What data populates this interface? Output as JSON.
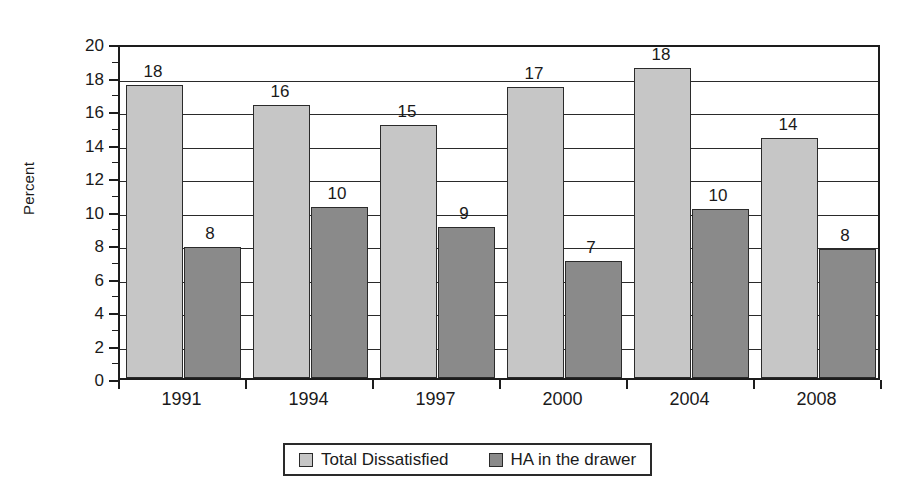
{
  "chart_data": {
    "type": "bar",
    "title": "",
    "xlabel": "",
    "ylabel": "Percent",
    "ylim": [
      0,
      20
    ],
    "ytick_step": 2,
    "yticks": [
      0,
      2,
      4,
      6,
      8,
      10,
      12,
      14,
      16,
      18,
      20
    ],
    "grid": true,
    "legend_position": "bottom",
    "categories": [
      "1991",
      "1994",
      "1997",
      "2000",
      "2004",
      "2008"
    ],
    "series": [
      {
        "name": "Total Dissatisfied",
        "color": "#c6c6c6",
        "values": [
          17.5,
          16.3,
          15.1,
          17.4,
          18.5,
          14.3
        ],
        "labels": [
          "18",
          "16",
          "15",
          "17",
          "18",
          "14"
        ]
      },
      {
        "name": "HA in the drawer",
        "color": "#8a8a8a",
        "values": [
          7.8,
          10.2,
          9.0,
          7.0,
          10.1,
          7.7
        ],
        "labels": [
          "8",
          "10",
          "9",
          "7",
          "10",
          "8"
        ]
      }
    ]
  },
  "legend": {
    "items": [
      {
        "label": "Total Dissatisfied",
        "swatch": "legend-swatch-total-dissatisfied"
      },
      {
        "label": "HA in the drawer",
        "swatch": "legend-swatch-ha-in-the-drawer"
      }
    ]
  },
  "axis": {
    "y_title": "Percent"
  },
  "colors": {
    "series_0": "#c6c6c6",
    "series_1": "#8a8a8a",
    "axis": "#1d1d1d",
    "grid": "#2a2a2a",
    "text": "#1a1a1a",
    "background": "#ffffff"
  }
}
